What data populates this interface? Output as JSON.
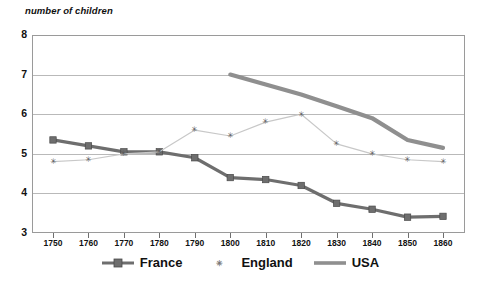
{
  "chart_data": {
    "type": "line",
    "title": "number of children",
    "xlabel": "",
    "ylabel": "number of children",
    "x": [
      1750,
      1760,
      1770,
      1780,
      1790,
      1800,
      1810,
      1820,
      1830,
      1840,
      1850,
      1860
    ],
    "xtick_labels": [
      "1750",
      "1760",
      "1770",
      "1780",
      "1790",
      "1800",
      "1810",
      "1820",
      "1830",
      "1840",
      "1850",
      "1860"
    ],
    "ytick_labels": [
      "3",
      "4",
      "5",
      "6",
      "7",
      "8"
    ],
    "yticks": [
      3,
      4,
      5,
      6,
      7,
      8
    ],
    "ylim": [
      3,
      8
    ],
    "xlim": [
      1745,
      1865
    ],
    "grid": "horizontal",
    "legend_position": "bottom",
    "series": [
      {
        "name": "France",
        "color": "#6e6e6e",
        "marker": "square",
        "values": [
          5.35,
          5.2,
          5.05,
          5.05,
          4.9,
          4.4,
          4.35,
          4.2,
          3.75,
          3.6,
          3.4,
          3.42
        ]
      },
      {
        "name": "England",
        "color": "#c8c8c8",
        "marker": "asterisk",
        "values": [
          4.8,
          4.85,
          5.0,
          5.05,
          5.6,
          5.45,
          5.8,
          6.0,
          5.25,
          5.0,
          4.85,
          4.8
        ]
      },
      {
        "name": "USA",
        "color": "#8f8f8f",
        "marker": "none",
        "values": [
          null,
          null,
          null,
          null,
          null,
          7.0,
          6.75,
          6.5,
          6.2,
          5.9,
          5.35,
          5.15
        ]
      }
    ]
  },
  "legend": {
    "items": [
      {
        "label": "France"
      },
      {
        "label": "England"
      },
      {
        "label": "USA"
      }
    ]
  },
  "colors": {
    "france": "#6e6e6e",
    "england": "#c8c8c8",
    "usa": "#8f8f8f",
    "grid": "#b9b9b9",
    "frame": "#9a9a9a",
    "text": "#111111"
  }
}
